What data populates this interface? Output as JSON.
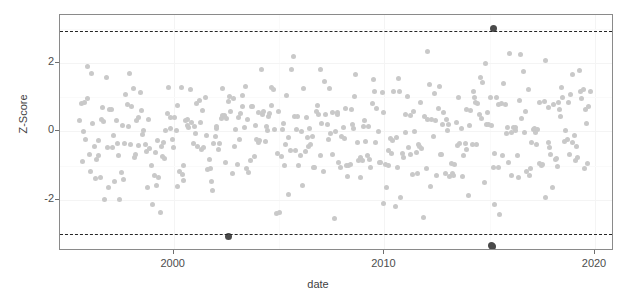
{
  "chart_data": {
    "type": "scatter",
    "title": "",
    "xlabel": "date",
    "ylabel": "Z-Score",
    "xlim": [
      1994.6,
      2020.9
    ],
    "ylim": [
      -3.5,
      3.4
    ],
    "xticks": [
      2000,
      2010,
      2020
    ],
    "xtick_labels": [
      "2000",
      "2010",
      "2020"
    ],
    "yticks": [
      2,
      0,
      -2
    ],
    "ytick_labels": [
      "2",
      "0",
      "-2"
    ],
    "grid": true,
    "legend": "none",
    "point_color": "#c9c9c9",
    "outlier_color": "#4a4a4a",
    "threshold_color": "#262626",
    "threshold_lines": [
      {
        "value": 2.94,
        "style": "dashed",
        "label": ""
      },
      {
        "value": -3.0,
        "style": "dashed",
        "label": ""
      }
    ],
    "n_points": 424,
    "series": [
      {
        "name": "z-score",
        "marker": "circle",
        "color": "#c9c9c9",
        "comment": "Monthly z-scores spanning 1995.5 to 2019.8, centered near 0 with spread ~0.9",
        "x_range": [
          1995.5,
          2019.8
        ],
        "mean": -0.05,
        "sd": 0.9
      },
      {
        "name": "outliers",
        "marker": "circle",
        "color": "#4a4a4a",
        "points": [
          {
            "x": 2015.2,
            "y": 3.0
          },
          {
            "x": 2002.6,
            "y": -3.07
          },
          {
            "x": 2015.1,
            "y": -3.35
          },
          {
            "x": 2015.15,
            "y": -3.38
          }
        ]
      }
    ]
  },
  "axes": {
    "x_title": "date",
    "y_title": "Z-Score"
  }
}
